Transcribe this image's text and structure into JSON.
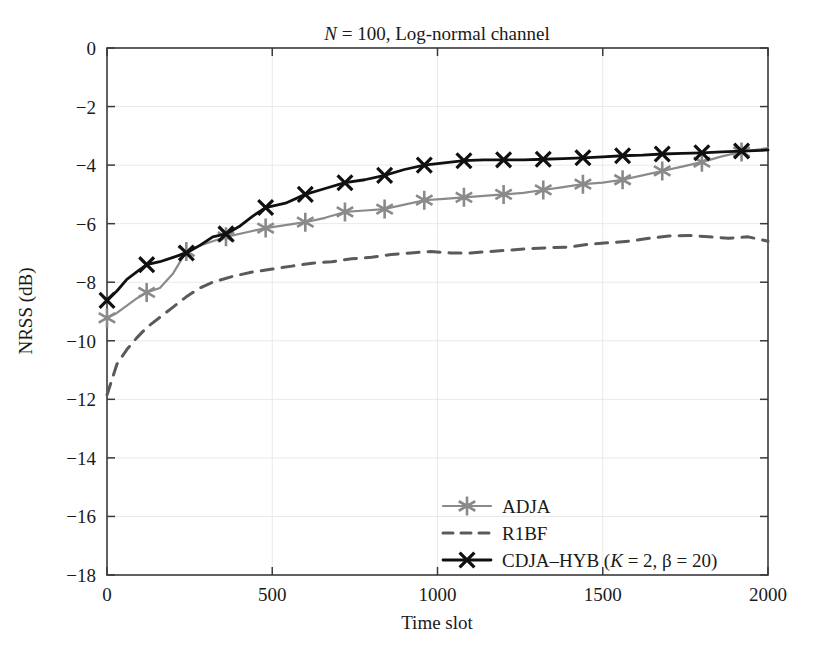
{
  "chart_data": {
    "type": "line",
    "title": "N = 100, Log-normal channel",
    "title_parts": {
      "italic": "N",
      "rest": " = 100, Log-normal channel"
    },
    "xlabel": "Time slot",
    "ylabel": "NRSS (dB)",
    "xlim": [
      0,
      2000
    ],
    "ylim": [
      -18,
      0
    ],
    "xticks": [
      0,
      500,
      1000,
      1500,
      2000
    ],
    "xticklabels": [
      "0",
      "500",
      "1000",
      "1500",
      "2000"
    ],
    "yticks": [
      0,
      -2,
      -4,
      -6,
      -8,
      -10,
      -12,
      -14,
      -16,
      -18
    ],
    "yticklabels": [
      "0",
      "−2",
      "−4",
      "−6",
      "−8",
      "−10",
      "−12",
      "−14",
      "−16",
      "−18"
    ],
    "grid": true,
    "grid_color": "#e9e9e9",
    "legend_position": "lower right",
    "series": [
      {
        "name": "ADJA",
        "color": "#8a8a8a",
        "style": "solid",
        "marker": "asterisk",
        "marker_every": 120,
        "x": [
          0,
          30,
          60,
          90,
          120,
          160,
          200,
          240,
          280,
          320,
          360,
          420,
          480,
          540,
          600,
          660,
          720,
          780,
          840,
          900,
          960,
          1020,
          1080,
          1140,
          1200,
          1260,
          1320,
          1380,
          1440,
          1500,
          1560,
          1620,
          1680,
          1740,
          1800,
          1860,
          1920,
          1980,
          2000
        ],
        "y": [
          -9.22,
          -9.05,
          -8.8,
          -8.55,
          -8.35,
          -8.2,
          -7.7,
          -6.95,
          -6.75,
          -6.6,
          -6.45,
          -6.3,
          -6.15,
          -6.05,
          -5.95,
          -5.8,
          -5.6,
          -5.55,
          -5.5,
          -5.35,
          -5.2,
          -5.15,
          -5.1,
          -5.05,
          -5.0,
          -4.95,
          -4.85,
          -4.75,
          -4.65,
          -4.6,
          -4.5,
          -4.35,
          -4.2,
          -4.05,
          -3.9,
          -3.7,
          -3.55,
          -3.45,
          -3.42
        ]
      },
      {
        "name": "R1BF",
        "color": "#5a5a5a",
        "style": "dashed",
        "marker": "none",
        "x": [
          0,
          30,
          60,
          90,
          120,
          160,
          200,
          240,
          280,
          320,
          380,
          440,
          500,
          560,
          620,
          680,
          740,
          800,
          860,
          920,
          980,
          1040,
          1100,
          1160,
          1220,
          1280,
          1340,
          1400,
          1460,
          1520,
          1580,
          1640,
          1700,
          1760,
          1820,
          1880,
          1940,
          2000
        ],
        "y": [
          -11.85,
          -10.8,
          -10.3,
          -9.9,
          -9.55,
          -9.2,
          -8.85,
          -8.5,
          -8.2,
          -8.0,
          -7.8,
          -7.65,
          -7.55,
          -7.45,
          -7.35,
          -7.3,
          -7.2,
          -7.15,
          -7.05,
          -7.0,
          -6.95,
          -7.0,
          -7.0,
          -6.95,
          -6.9,
          -6.85,
          -6.82,
          -6.8,
          -6.7,
          -6.65,
          -6.6,
          -6.5,
          -6.42,
          -6.4,
          -6.45,
          -6.5,
          -6.45,
          -6.6
        ]
      },
      {
        "name": "CDJA–HYB (K = 2, β = 20)",
        "name_parts": {
          "prefix": "CDJA–HYB (",
          "italic": "K",
          "mid": " = 2, β = 20)"
        },
        "color": "#101010",
        "style": "solid",
        "marker": "x",
        "marker_every": 120,
        "x": [
          0,
          30,
          60,
          90,
          120,
          160,
          200,
          240,
          280,
          320,
          360,
          400,
          440,
          480,
          540,
          600,
          660,
          720,
          780,
          840,
          900,
          960,
          1020,
          1080,
          1140,
          1200,
          1260,
          1320,
          1380,
          1440,
          1500,
          1560,
          1620,
          1680,
          1740,
          1800,
          1860,
          1920,
          1980,
          2000
        ],
        "y": [
          -8.62,
          -8.3,
          -7.9,
          -7.65,
          -7.4,
          -7.3,
          -7.15,
          -7.0,
          -6.75,
          -6.45,
          -6.35,
          -6.1,
          -5.75,
          -5.45,
          -5.3,
          -5.0,
          -4.8,
          -4.6,
          -4.5,
          -4.35,
          -4.15,
          -4.0,
          -3.92,
          -3.85,
          -3.82,
          -3.82,
          -3.82,
          -3.8,
          -3.78,
          -3.75,
          -3.72,
          -3.68,
          -3.66,
          -3.62,
          -3.6,
          -3.58,
          -3.55,
          -3.52,
          -3.5,
          -3.48
        ]
      }
    ]
  },
  "legend": {
    "entries": [
      {
        "label": "ADJA"
      },
      {
        "label": "R1BF"
      },
      {
        "label": "CDJA–HYB (K = 2, β = 20)"
      }
    ]
  }
}
